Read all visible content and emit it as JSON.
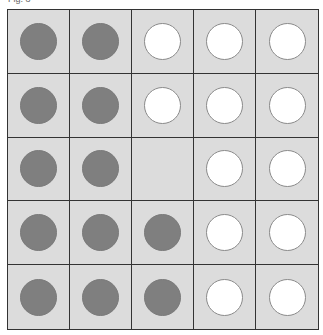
{
  "caption": "Fig. 8",
  "colors": {
    "cell_bg": "#dcdcdc",
    "filled": "#7f7f7f",
    "empty": "#ffffff",
    "grid_line": "#333333"
  },
  "grid": {
    "rows": 5,
    "cols": 5,
    "cells": [
      [
        "filled",
        "filled",
        "empty",
        "empty",
        "empty"
      ],
      [
        "filled",
        "filled",
        "empty",
        "empty",
        "empty"
      ],
      [
        "filled",
        "filled",
        "none",
        "empty",
        "empty"
      ],
      [
        "filled",
        "filled",
        "filled",
        "empty",
        "empty"
      ],
      [
        "filled",
        "filled",
        "filled",
        "empty",
        "empty"
      ]
    ]
  }
}
